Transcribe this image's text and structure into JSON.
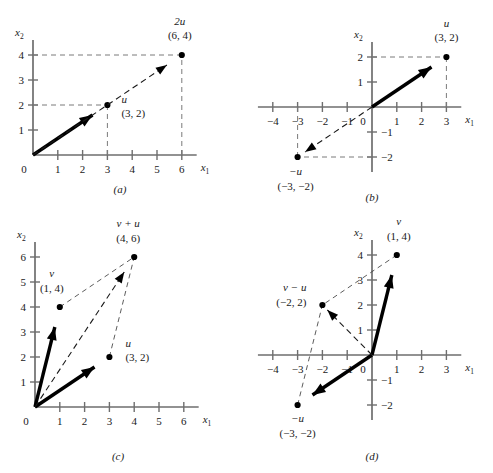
{
  "figure": {
    "axis_x_label": "x",
    "axis_x_sub": "1",
    "axis_y_label": "x",
    "axis_y_sub": "2",
    "origin_label": "0"
  },
  "chart_data": {
    "type": "scatter",
    "xlabel": "x1",
    "ylabel": "x2",
    "grid": false,
    "legend": "none",
    "panels": [
      {
        "id": "a",
        "caption": "(a)",
        "xlim": [
          0,
          6.6
        ],
        "ylim": [
          0,
          4.6
        ],
        "xticks": [
          0,
          1,
          2,
          3,
          4,
          5,
          6
        ],
        "yticks": [
          0,
          1,
          2,
          3,
          4
        ],
        "xtick_labels": [
          "0",
          "1",
          "2",
          "3",
          "4",
          "5",
          "6"
        ],
        "ytick_labels": [
          "0",
          "1",
          "2",
          "3",
          "4"
        ],
        "vectors": [
          {
            "name": "u",
            "label": "u",
            "coords": "(3, 2)",
            "x": 3,
            "y": 2,
            "style": "solid"
          },
          {
            "name": "2u",
            "label": "2u",
            "coords": "(6, 4)",
            "x": 6,
            "y": 4,
            "style": "dashed"
          }
        ],
        "guides": [
          {
            "from": [
              0,
              2
            ],
            "to": [
              3,
              2
            ]
          },
          {
            "from": [
              3,
              0
            ],
            "to": [
              3,
              2
            ]
          },
          {
            "from": [
              0,
              4
            ],
            "to": [
              6,
              4
            ]
          },
          {
            "from": [
              6,
              0
            ],
            "to": [
              6,
              4
            ]
          }
        ]
      },
      {
        "id": "b",
        "caption": "(b)",
        "xlim": [
          -4.6,
          3.6
        ],
        "ylim": [
          -2.6,
          2.6
        ],
        "xticks": [
          -4,
          -3,
          -2,
          -1,
          0,
          1,
          2,
          3
        ],
        "yticks": [
          -2,
          -1,
          0,
          1,
          2
        ],
        "xtick_labels": [
          "−4",
          "−3",
          "−2",
          "−1",
          "0",
          "1",
          "2",
          "3"
        ],
        "ytick_labels": [
          "−2",
          "−1",
          "0",
          "1",
          "2"
        ],
        "vectors": [
          {
            "name": "u",
            "label": "u",
            "coords": "(3, 2)",
            "x": 3,
            "y": 2,
            "style": "solid"
          },
          {
            "name": "-u",
            "label": "−u",
            "coords": "(−3, −2)",
            "x": -3,
            "y": -2,
            "style": "dashed"
          }
        ],
        "guides": [
          {
            "from": [
              0,
              2
            ],
            "to": [
              3,
              2
            ]
          },
          {
            "from": [
              3,
              0
            ],
            "to": [
              3,
              2
            ]
          },
          {
            "from": [
              -3,
              0
            ],
            "to": [
              -3,
              -2
            ]
          },
          {
            "from": [
              0,
              -2
            ],
            "to": [
              -3,
              -2
            ]
          }
        ]
      },
      {
        "id": "c",
        "caption": "(c)",
        "xlim": [
          0,
          6.6
        ],
        "ylim": [
          0,
          6.6
        ],
        "xticks": [
          0,
          1,
          2,
          3,
          4,
          5,
          6
        ],
        "yticks": [
          0,
          1,
          2,
          3,
          4,
          5,
          6
        ],
        "xtick_labels": [
          "0",
          "1",
          "2",
          "3",
          "4",
          "5",
          "6"
        ],
        "ytick_labels": [
          "0",
          "1",
          "2",
          "3",
          "4",
          "5",
          "6"
        ],
        "vectors": [
          {
            "name": "v",
            "label": "v",
            "coords": "(1, 4)",
            "x": 1,
            "y": 4,
            "style": "solid"
          },
          {
            "name": "u",
            "label": "u",
            "coords": "(3, 2)",
            "x": 3,
            "y": 2,
            "style": "solid"
          },
          {
            "name": "v+u",
            "label": "v + u",
            "coords": "(4, 6)",
            "x": 4,
            "y": 6,
            "style": "dashed"
          }
        ],
        "parallelogram": [
          [
            1,
            4
          ],
          [
            4,
            6
          ],
          [
            3,
            2
          ]
        ]
      },
      {
        "id": "d",
        "caption": "(d)",
        "xlim": [
          -4.6,
          3.6
        ],
        "ylim": [
          -2.6,
          4.6
        ],
        "xticks": [
          -4,
          -3,
          -2,
          -1,
          0,
          1,
          2,
          3
        ],
        "yticks": [
          -2,
          -1,
          0,
          1,
          2,
          3,
          4
        ],
        "xtick_labels": [
          "−4",
          "−3",
          "−2",
          "−1",
          "0",
          "1",
          "2",
          "3"
        ],
        "ytick_labels": [
          "−2",
          "−1",
          "0",
          "1",
          "2",
          "3",
          "4"
        ],
        "vectors": [
          {
            "name": "v",
            "label": "v",
            "coords": "(1, 4)",
            "x": 1,
            "y": 4,
            "style": "solid"
          },
          {
            "name": "-u",
            "label": "−u",
            "coords": "(−3, −2)",
            "x": -3,
            "y": -2,
            "style": "solid"
          },
          {
            "name": "v-u",
            "label": "v − u",
            "coords": "(−2, 2)",
            "x": -2,
            "y": 2,
            "style": "dashed"
          }
        ],
        "parallelogram": [
          [
            1,
            4
          ],
          [
            -2,
            2
          ],
          [
            -3,
            -2
          ]
        ]
      }
    ]
  }
}
